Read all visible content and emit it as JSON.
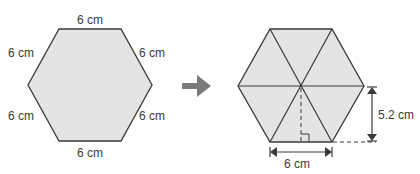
{
  "colors": {
    "fill": "#e4e4e4",
    "stroke": "#3a3a3a",
    "arrow": "#7a7a7a"
  },
  "left_hexagon": {
    "side_labels": {
      "top": "6 cm",
      "upper_left": "6 cm",
      "upper_right": "6 cm",
      "lower_left": "6 cm",
      "lower_right": "6 cm",
      "bottom": "6 cm"
    }
  },
  "right_hexagon": {
    "base_label": "6 cm",
    "height_label": "5.2 cm",
    "triangles": 6
  }
}
